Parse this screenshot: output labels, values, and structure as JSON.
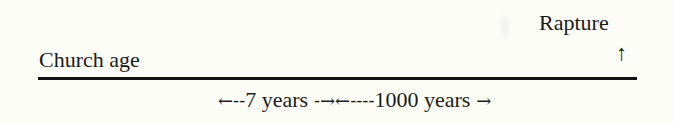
{
  "diagram": {
    "type": "timeline",
    "left_label": "Church age",
    "event_label": "Rapture",
    "event_marker": "↑",
    "periods": [
      {
        "arrow_left": "←--",
        "label": "7 years",
        "arrow_right": " -→"
      },
      {
        "arrow_left": "←----",
        "label": "1000 years",
        "arrow_right": " →"
      }
    ],
    "colors": {
      "background": "#fdfdf8",
      "ink": "#1a1a1a",
      "line": "#111111"
    }
  }
}
